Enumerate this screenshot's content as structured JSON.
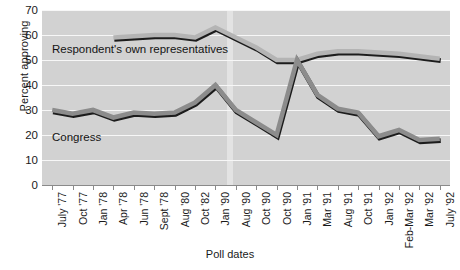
{
  "chart_data": {
    "type": "line",
    "title": "",
    "xlabel": "Poll dates",
    "ylabel": "Percent approving",
    "ylim": [
      0,
      70
    ],
    "ytick_step": 10,
    "yticks": [
      70,
      60,
      50,
      40,
      30,
      20,
      10,
      0
    ],
    "grid": true,
    "legend_position": "inline-annotation",
    "categories": [
      "July '77",
      "Oct '77",
      "Jan '78",
      "Apr '78",
      "Jun '78",
      "Sept '78",
      "Aug '80",
      "Oct '82",
      "Jan '90",
      "Aug '90",
      "Oct '90",
      "Oct '90",
      "Jan '91",
      "Mar '91",
      "Aug '91",
      "Oct '91",
      "Jan '92",
      "Feb-Mar '92",
      "Mar '92",
      "July '92"
    ],
    "series": [
      {
        "name": "Respondent's own representatives",
        "color": "#b4b4b4",
        "values": [
          null,
          null,
          null,
          59,
          59.5,
          60,
          60,
          59,
          63,
          59,
          55,
          50,
          50,
          52.5,
          53.5,
          53.5,
          53,
          52.5,
          51.5,
          50.5
        ]
      },
      {
        "name": "Congress",
        "color": "#8c8c8c",
        "values": [
          30,
          28.5,
          30,
          27,
          29,
          28.5,
          29,
          33,
          40,
          30,
          25,
          20,
          50,
          36,
          30.5,
          29,
          19.5,
          22,
          18,
          18.5
        ]
      }
    ],
    "annotations": [
      {
        "id": "reps-label",
        "text": "Respondent's own representatives"
      },
      {
        "id": "congress-label",
        "text": "Congress"
      }
    ]
  },
  "axis": {
    "y_title": "Percent approving",
    "x_title": "Poll dates"
  },
  "colors": {
    "plot_background": "#d2d2d2",
    "gridline": "#f7f7f7",
    "axis": "#8a8a8a",
    "series_representatives": "#b4b4b4",
    "series_congress": "#8c8c8c",
    "series_shadow": "#1c1c1c",
    "band_highlight": "#e8e8e8"
  }
}
